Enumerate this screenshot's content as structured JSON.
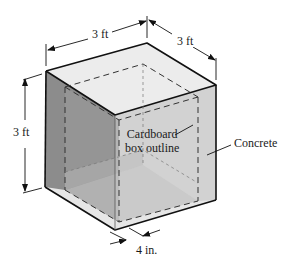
{
  "figure": {
    "colors": {
      "top_face": "#ececec",
      "left_face": "#8a8a8a",
      "right_face": "#d0d0d0",
      "inner_floor": "#c8c8c8",
      "inner_left_wall": "#9a9a9a",
      "edge": "#111111",
      "dashed": "#333333"
    }
  },
  "dimensions": {
    "width_top": "3 ft",
    "depth_top": "3 ft",
    "height_left": "3 ft",
    "wall_thickness": "4 in."
  },
  "labels": {
    "cardboard_line1": "Cardboard",
    "cardboard_line2": "box outline",
    "concrete": "Concrete"
  }
}
